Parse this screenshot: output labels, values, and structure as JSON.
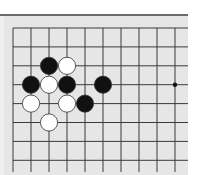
{
  "board": {
    "title": "",
    "grid": {
      "origin_x": 13,
      "origin_y": 28,
      "spacing_x": 18,
      "spacing_y": 18.9,
      "cols": 10,
      "rows": 8,
      "line_end_x": 188,
      "line_end_y": 172,
      "line_color": "#3a3a3a"
    },
    "star_points": [
      {
        "col": 9,
        "row": 3
      }
    ],
    "stones": [
      {
        "color": "black",
        "col": 2,
        "row": 2
      },
      {
        "color": "white",
        "col": 3,
        "row": 2
      },
      {
        "color": "black",
        "col": 1,
        "row": 3
      },
      {
        "color": "white",
        "col": 2,
        "row": 3
      },
      {
        "color": "black",
        "col": 3,
        "row": 3
      },
      {
        "color": "black",
        "col": 5,
        "row": 3
      },
      {
        "color": "white",
        "col": 1,
        "row": 4
      },
      {
        "color": "white",
        "col": 3,
        "row": 4
      },
      {
        "color": "black",
        "col": 4,
        "row": 4
      },
      {
        "color": "white",
        "col": 2,
        "row": 5
      }
    ],
    "colors": {
      "board_bg": "#e6e6e6",
      "black_stone": "#111111",
      "white_stone": "#ffffff",
      "stone_outline": "#333333"
    }
  }
}
